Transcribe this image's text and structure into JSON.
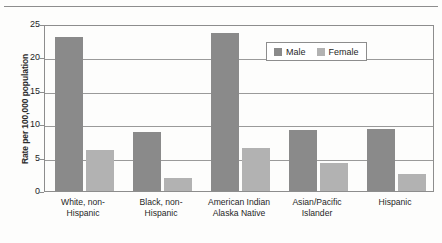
{
  "chart_data": {
    "type": "bar",
    "title": "",
    "subtitle": "",
    "xlabel": "",
    "ylabel": "Rate per 100,000 population",
    "ylim": [
      0,
      25
    ],
    "yticks": [
      0,
      5,
      10,
      15,
      20,
      25
    ],
    "ytick_labels": [
      "0",
      "5",
      "10",
      "15",
      "20",
      "25"
    ],
    "grid": true,
    "grid_axis": "y",
    "legend_position": "upper-center-right",
    "categories": [
      "White, non-Hispanic",
      "Black, non-Hispanic",
      "American Indian Alaska Native",
      "Asian/Pacific Islander",
      "Hispanic"
    ],
    "category_lines": [
      [
        "White, non-",
        "Hispanic"
      ],
      [
        "Black, non-",
        "Hispanic"
      ],
      [
        "American Indian",
        "Alaska Native"
      ],
      [
        "Asian/Pacific",
        "Islander"
      ],
      [
        "Hispanic"
      ]
    ],
    "series": [
      {
        "name": "Male",
        "color": "#8a8a8a",
        "values": [
          23.0,
          8.8,
          23.6,
          9.1,
          9.3
        ]
      },
      {
        "name": "Female",
        "color": "#b2b2b2",
        "values": [
          6.1,
          2.0,
          6.4,
          4.2,
          2.5
        ]
      }
    ]
  },
  "legend": {
    "entries": [
      {
        "label": "Male",
        "color": "#8a8a8a"
      },
      {
        "label": "Female",
        "color": "#b2b2b2"
      }
    ]
  },
  "axes": {
    "y_title": "Rate per 100,000 population"
  }
}
